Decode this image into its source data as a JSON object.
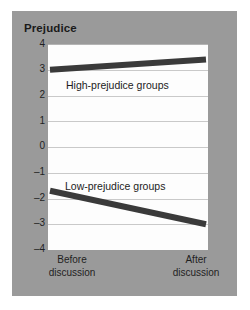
{
  "chart_data": {
    "type": "line",
    "title": "Prejudice",
    "xlabel": "",
    "ylabel": "Prejudice",
    "ylim": [
      -4,
      4
    ],
    "yticks": [
      "4",
      "3",
      "2",
      "1",
      "0",
      "–1",
      "–2",
      "–3",
      "–4"
    ],
    "ytick_values": [
      4,
      3,
      2,
      1,
      0,
      -1,
      -2,
      -3,
      -4
    ],
    "grid": true,
    "legend_position": "inline-annotations",
    "categories": [
      "Before discussion",
      "After discussion"
    ],
    "x": [
      0,
      1
    ],
    "series": [
      {
        "name": "High-prejudice groups",
        "values": [
          3.0,
          3.4
        ],
        "color": "#3a3a3a"
      },
      {
        "name": "Low-prejudice groups",
        "values": [
          -1.7,
          -3.0
        ],
        "color": "#3a3a3a"
      }
    ],
    "annotations": [
      {
        "text": "High-prejudice groups",
        "series": "High-prejudice groups"
      },
      {
        "text": "Low-prejudice groups",
        "series": "Low-prejudice groups"
      }
    ]
  },
  "axes": {
    "x_tick_labels": [
      {
        "line1": "Before",
        "line2": "discussion"
      },
      {
        "line1": "After",
        "line2": "discussion"
      }
    ]
  },
  "colors": {
    "panel_background": "#9a9a9a",
    "plot_background": "#fdfdfd",
    "gridline": "#c9c9c9",
    "line": "#3a3a3a",
    "text": "#1f1f1f",
    "page_background": "#ffffff"
  }
}
